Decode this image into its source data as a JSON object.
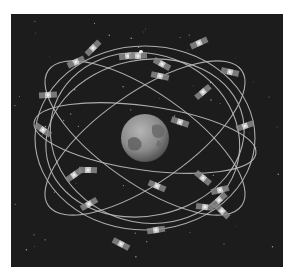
{
  "image": {
    "subject": "GPS satellite constellation orbiting Earth",
    "style": "grayscale illustration",
    "colors": {
      "background": "#ffffff",
      "space": "#1c1c1c",
      "orbit": "#bdbdbd",
      "earth_light": "#a8a8a8",
      "earth_dark": "#4a4a4a"
    },
    "orbit_count": 6,
    "satellite_count": 24
  }
}
